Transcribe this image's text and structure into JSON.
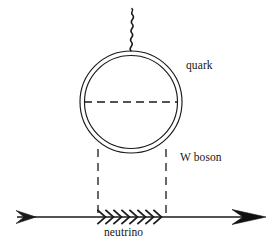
{
  "figure": {
    "kind": "feynman-diagram",
    "title": "",
    "background_color": "#ffffff",
    "stroke_color": "#1a1a1a",
    "text_color": "#161616",
    "width": 276,
    "height": 249
  },
  "labels": {
    "quark": "quark",
    "w_boson": "W boson",
    "neutrino": "neutrino"
  },
  "diagram_data": {
    "type": "diagram",
    "elements": [
      {
        "name": "quark-loop",
        "shape": "double-circle",
        "center": [
          131,
          102
        ],
        "outer_radius": 51,
        "inner_radius": 47,
        "stroke": "#1a1a1a",
        "fill": "none",
        "label": "quark"
      },
      {
        "name": "gluon-wavy-line",
        "shape": "wavy-vertical-line",
        "from": [
          131,
          51
        ],
        "to": [
          131,
          9
        ],
        "oscillations": 5,
        "amplitude": 4,
        "stroke": "#1a1a1a"
      },
      {
        "name": "quark-loop-dashed-diameter",
        "shape": "dashed-horizontal-line",
        "from": [
          84,
          102
        ],
        "to": [
          178,
          102
        ],
        "stroke": "#1a1a1a",
        "dash": "7 5"
      },
      {
        "name": "w-boson-left-dashed-line",
        "shape": "dashed-vertical-line",
        "from": [
          98,
          150
        ],
        "to": [
          98,
          217
        ],
        "stroke": "#1a1a1a",
        "dash": "7 5"
      },
      {
        "name": "w-boson-right-dashed-line",
        "shape": "dashed-vertical-line",
        "from": [
          166,
          150
        ],
        "to": [
          166,
          217
        ],
        "stroke": "#1a1a1a",
        "dash": "7 5",
        "label": "W boson"
      },
      {
        "name": "fermion-baseline",
        "shape": "horizontal-line",
        "from": [
          16,
          217
        ],
        "to": [
          264,
          217
        ],
        "stroke": "#1a1a1a"
      },
      {
        "name": "incoming-arrowhead",
        "shape": "arrowhead-right-open",
        "at": [
          34,
          217
        ]
      },
      {
        "name": "outgoing-arrowhead",
        "shape": "arrowhead-right-filled",
        "at": [
          264,
          217
        ]
      },
      {
        "name": "neutrino-chevrons",
        "shape": "chevron-series",
        "from": [
          99,
          217
        ],
        "to": [
          166,
          217
        ],
        "count": 9,
        "label": "neutrino"
      }
    ]
  }
}
